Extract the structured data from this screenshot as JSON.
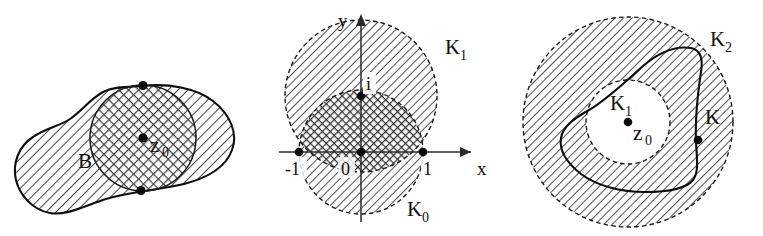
{
  "figure": {
    "caption": "",
    "background_color": "#ffffff",
    "ink_color": "#101010"
  },
  "panels": [
    {
      "id": "panel-b",
      "name": "region-b-with-disc",
      "labels": {
        "region": "B",
        "center_point": "z",
        "center_point_sub": "0"
      },
      "marked_points": [
        {
          "name": "upper-tangency-point"
        },
        {
          "name": "center-point"
        },
        {
          "name": "lower-tangency-point"
        }
      ],
      "fills": {
        "outer_region": "diagonal-hatch",
        "inner_disc": "cross-hatch"
      }
    },
    {
      "id": "panel-k0k1",
      "name": "unit-discs-k0-k1",
      "axes": {
        "x_label": "x",
        "y_label": "y"
      },
      "tick_labels": {
        "left": "-1",
        "origin": "0",
        "right": "1",
        "imaginary": "i"
      },
      "labels": {
        "upper_disc": "K",
        "upper_disc_sub": "1",
        "lower_disc": "K",
        "lower_disc_sub": "0"
      },
      "marked_points": [
        {
          "name": "point-minus-one"
        },
        {
          "name": "point-origin"
        },
        {
          "name": "point-one"
        },
        {
          "name": "point-i"
        }
      ],
      "fills": {
        "discs": "diagonal-hatch",
        "overlap": "cross-hatch"
      }
    },
    {
      "id": "panel-k2",
      "name": "annulus-k2-with-contour-k",
      "labels": {
        "outer_disc": "K",
        "outer_disc_sub": "2",
        "inner_disc": "K",
        "inner_disc_sub": "1",
        "center_point": "z",
        "center_point_sub": "0",
        "contour": "K"
      },
      "marked_points": [
        {
          "name": "center-point"
        },
        {
          "name": "contour-point"
        }
      ],
      "fills": {
        "annulus": "diagonal-hatch",
        "inner_disc": "none"
      }
    }
  ]
}
